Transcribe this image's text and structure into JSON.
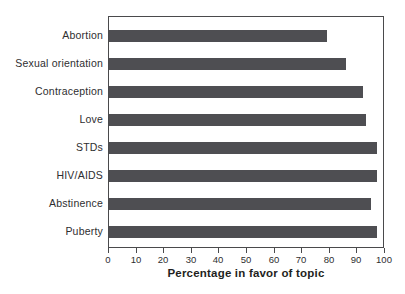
{
  "chart_data": {
    "type": "bar",
    "orientation": "horizontal",
    "title": "",
    "categories": [
      "Abortion",
      "Sexual orientation",
      "Contraception",
      "Love",
      "STDs",
      "HIV/AIDS",
      "Abstinence",
      "Puberty"
    ],
    "values": [
      79,
      86,
      92,
      93,
      97,
      97,
      95,
      97
    ],
    "xlabel": "Percentage in favor of topic",
    "ylabel": "",
    "xlim": [
      0,
      100
    ],
    "xticks": [
      0,
      10,
      20,
      30,
      40,
      50,
      60,
      70,
      80,
      90,
      100
    ],
    "grid": false,
    "plot_border": true,
    "legend": "none",
    "colors": {
      "bar": "#4e4e52",
      "axis_line": "#4a4a4c",
      "tick_text": "#2e2e30",
      "label_text": "#2e2e30",
      "background": "#ffffff"
    }
  }
}
